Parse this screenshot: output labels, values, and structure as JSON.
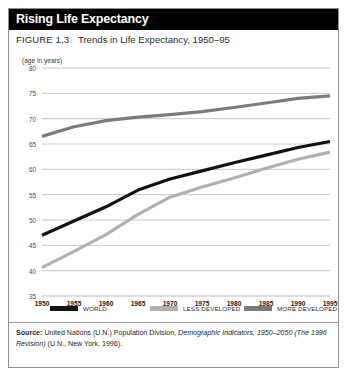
{
  "figure": {
    "title": "Rising Life Expectancy",
    "figure_label": "FIGURE 1.3",
    "figure_caption": "Trends in Life Expectancy, 1950–95",
    "unit_caption": "(age in years)",
    "source_prefix": "Source:",
    "source_text_1": " United Nations (U.N.) Population Division, ",
    "source_italic": "Demographic Indicators, 1950–2050 (The 1996 Revision)",
    "source_text_2": " (U.N., New York, 1996)."
  },
  "colors": {
    "title_bar": "#000000",
    "title_text": "#ffffff",
    "border": "#8f8f8f",
    "grid": "#b9b9b9",
    "world": "#111111",
    "less_developed": "#b0b0b0",
    "more_developed": "#7c7c7c",
    "background": "#ffffff"
  },
  "chart_data": {
    "type": "line",
    "title": "Rising Life Expectancy",
    "subtitle": "FIGURE 1.3  Trends in Life Expectancy, 1950–95",
    "xlabel": "",
    "ylabel": "(age in years)",
    "x": [
      1950,
      1955,
      1960,
      1965,
      1970,
      1975,
      1980,
      1985,
      1990,
      1995
    ],
    "xtick_labels": [
      "1950",
      "1955",
      "1960",
      "1965",
      "1970",
      "1975",
      "1980",
      "1985",
      "1990",
      "1995"
    ],
    "ytick_labels": [
      "35",
      "40",
      "45",
      "50",
      "55",
      "60",
      "65",
      "70",
      "75",
      "80"
    ],
    "yticks": [
      35,
      40,
      45,
      50,
      55,
      60,
      65,
      70,
      75,
      80
    ],
    "xlim": [
      1950,
      1995
    ],
    "ylim": [
      35,
      80
    ],
    "grid": "horizontal",
    "legend_position": "bottom",
    "series": [
      {
        "name": "WORLD",
        "color": "#111111",
        "values": [
          47.0,
          49.8,
          52.6,
          55.9,
          58.1,
          59.7,
          61.3,
          62.8,
          64.3,
          65.5
        ]
      },
      {
        "name": "LESS DEVELOPED",
        "color": "#b0b0b0",
        "values": [
          40.6,
          43.8,
          47.1,
          51.1,
          54.5,
          56.5,
          58.3,
          60.2,
          62.0,
          63.4
        ]
      },
      {
        "name": "MORE DEVELOPED",
        "color": "#7c7c7c",
        "values": [
          66.5,
          68.4,
          69.6,
          70.3,
          70.8,
          71.4,
          72.2,
          73.1,
          74.0,
          74.5
        ]
      }
    ]
  }
}
